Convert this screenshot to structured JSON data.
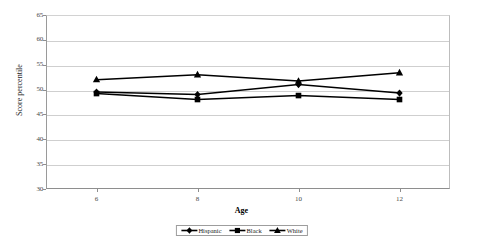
{
  "chart_data": {
    "type": "line",
    "title": "",
    "xlabel": "Age",
    "ylabel": "Score percentile",
    "x": [
      6,
      8,
      10,
      12
    ],
    "xticklabels": [
      "6",
      "8",
      "10",
      "12"
    ],
    "yticklabels": [
      "65",
      "60",
      "55",
      "50",
      "45",
      "40",
      "35",
      "30"
    ],
    "xlim": [
      5,
      13
    ],
    "ylim": [
      30,
      65
    ],
    "ytick_step": 5,
    "grid": true,
    "legend_position": "bottom-center",
    "series": [
      {
        "name": "Hispanic",
        "marker": "diamond",
        "color": "#000000",
        "values": [
          49.5,
          49.0,
          51.0,
          49.3
        ]
      },
      {
        "name": "Black",
        "marker": "square",
        "color": "#000000",
        "values": [
          49.2,
          48.0,
          48.8,
          48.0
        ]
      },
      {
        "name": "White",
        "marker": "triangle",
        "color": "#000000",
        "values": [
          52.0,
          53.0,
          51.7,
          53.4
        ]
      }
    ]
  },
  "legend": {
    "items": [
      {
        "label": "Hispanic",
        "marker": "diamond-marker-icon"
      },
      {
        "label": "Black",
        "marker": "square-marker-icon"
      },
      {
        "label": "White",
        "marker": "triangle-marker-icon"
      }
    ]
  },
  "axes": {
    "x_title": "Age",
    "y_title": "Score percentile"
  },
  "colors": {
    "series": "#000000",
    "gridline": "#cfcfcf",
    "axis": "#8e8e8e",
    "background": "#ffffff"
  }
}
